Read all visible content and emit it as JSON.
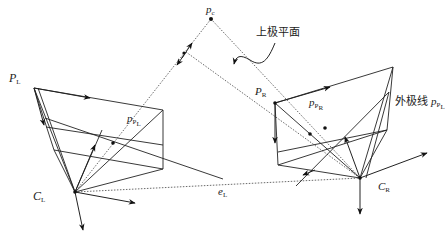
{
  "diagram": {
    "type": "epipolar-geometry",
    "labels": {
      "point_world": "p",
      "point_world_sub": "c",
      "epipolar_plane": "上极平面",
      "left_image_plane": "P",
      "left_image_plane_sub": "L",
      "right_image_plane": "P",
      "right_image_plane_sub": "R",
      "left_projection": "p",
      "left_projection_sub": "P",
      "left_projection_subsub": "L",
      "right_projection": "p",
      "right_projection_sub": "P",
      "right_projection_subsub": "R",
      "epipolar_line": "外极线",
      "epipolar_line_point": "p",
      "epipolar_line_sub": "P",
      "epipolar_line_subsub": "L",
      "left_camera_center": "C",
      "left_camera_center_sub": "L",
      "right_camera_center": "C",
      "right_camera_center_sub": "R",
      "epipole": "e",
      "epipole_sub": "L"
    },
    "colors": {
      "stroke": "#222222",
      "dotted": "#444444",
      "background": "#ffffff"
    }
  }
}
